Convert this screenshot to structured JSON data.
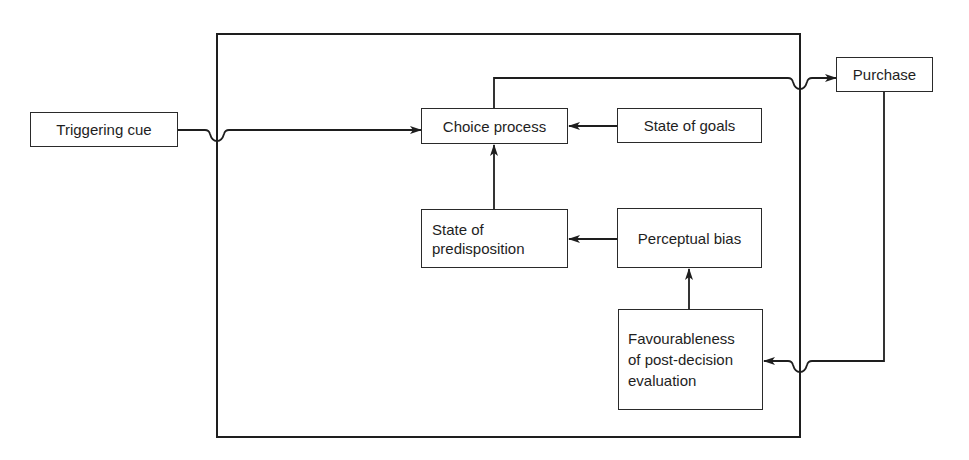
{
  "diagram": {
    "type": "flowchart",
    "nodes": {
      "triggering_cue": {
        "label": "Triggering cue"
      },
      "choice_process": {
        "label": "Choice process"
      },
      "state_of_goals": {
        "label": "State of goals"
      },
      "purchase": {
        "label": "Purchase"
      },
      "state_of_predisposition": {
        "label": "State of\npredisposition"
      },
      "perceptual_bias": {
        "label": "Perceptual bias"
      },
      "favourableness": {
        "label": "Favourableness\nof post-decision\nevaluation"
      }
    },
    "edges": [
      {
        "from": "Triggering cue",
        "to": "Choice process"
      },
      {
        "from": "State of goals",
        "to": "Choice process"
      },
      {
        "from": "State of predisposition",
        "to": "Choice process"
      },
      {
        "from": "Choice process",
        "to": "Purchase"
      },
      {
        "from": "Perceptual bias",
        "to": "State of predisposition"
      },
      {
        "from": "Favourableness of post-decision evaluation",
        "to": "Perceptual bias"
      },
      {
        "from": "Purchase",
        "to": "Favourableness of post-decision evaluation"
      }
    ],
    "colors": {
      "line": "#1e1e1e",
      "background": "#ffffff"
    }
  }
}
